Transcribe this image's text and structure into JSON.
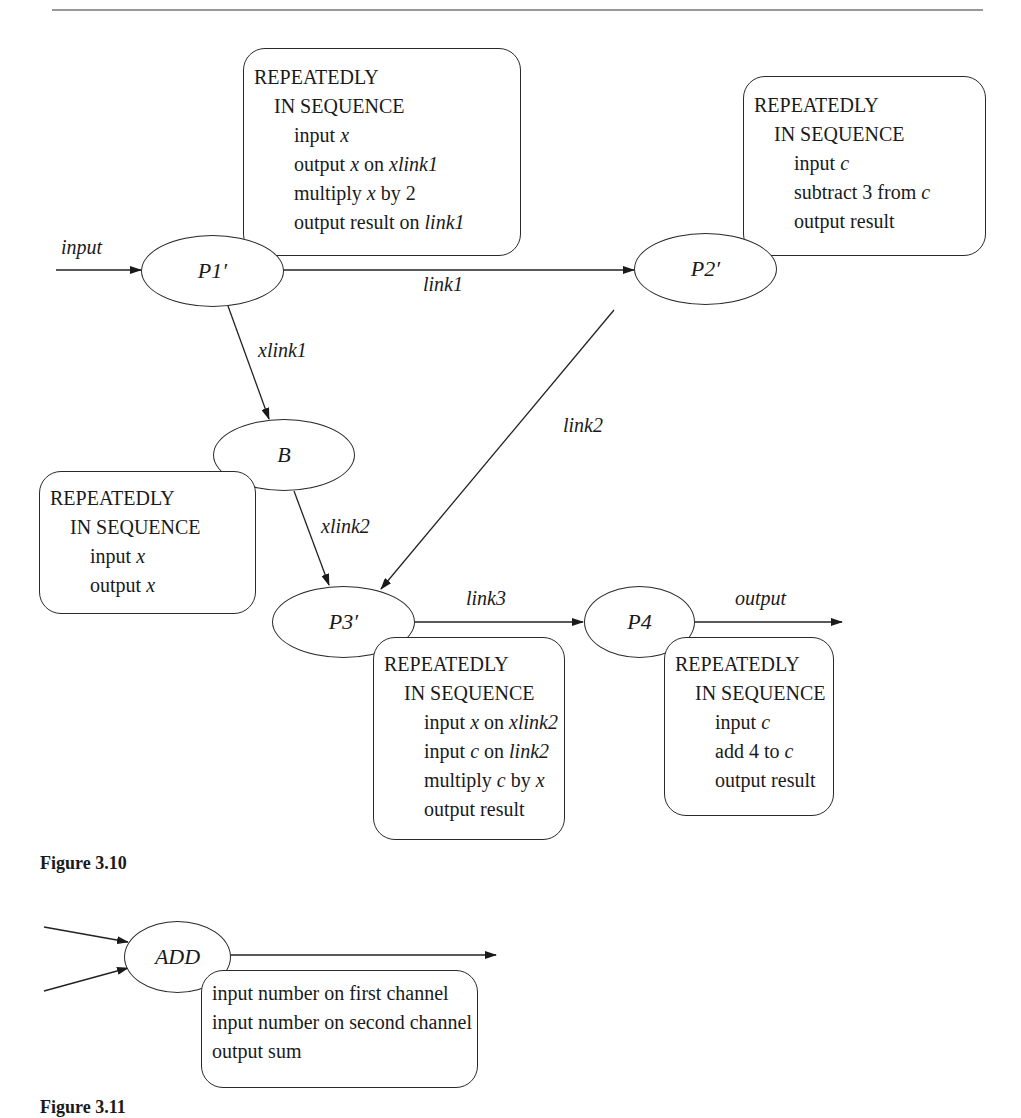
{
  "figure_3_10": {
    "caption": "Figure 3.10",
    "nodes": {
      "p1": "P1′",
      "p2": "P2′",
      "b": "B",
      "p3": "P3′",
      "p4": "P4"
    },
    "edges": {
      "input": "input",
      "link1": "link1",
      "xlink1": "xlink1",
      "link2": "link2",
      "xlink2": "xlink2",
      "link3": "link3",
      "output": "output"
    },
    "boxes": {
      "p1": {
        "header1": "REPEATEDLY",
        "header2": "IN SEQUENCE",
        "lines": [
          {
            "a": "input ",
            "b": "x",
            "c": "",
            "d": ""
          },
          {
            "a": "output ",
            "b": "x",
            "c": " on ",
            "d": "xlink1"
          },
          {
            "a": "multiply ",
            "b": "x",
            "c": " by 2",
            "d": ""
          },
          {
            "a": "output result on ",
            "b": "",
            "c": "",
            "d": "link1"
          }
        ]
      },
      "p2": {
        "header1": "REPEATEDLY",
        "header2": "IN SEQUENCE",
        "lines": [
          {
            "a": "input ",
            "b": "c",
            "c": "",
            "d": ""
          },
          {
            "a": "subtract 3 from ",
            "b": "c",
            "c": "",
            "d": ""
          },
          {
            "a": "output result",
            "b": "",
            "c": "",
            "d": ""
          }
        ]
      },
      "b": {
        "header1": "REPEATEDLY",
        "header2": "IN SEQUENCE",
        "lines": [
          {
            "a": "input ",
            "b": "x",
            "c": "",
            "d": ""
          },
          {
            "a": "output ",
            "b": "x",
            "c": "",
            "d": ""
          }
        ]
      },
      "p3": {
        "header1": "REPEATEDLY",
        "header2": "IN SEQUENCE",
        "lines": [
          {
            "a": "input ",
            "b": "x",
            "c": " on ",
            "d": "xlink2"
          },
          {
            "a": "input ",
            "b": "c",
            "c": " on ",
            "d": "link2"
          },
          {
            "a": "multiply ",
            "b": "c",
            "c": " by ",
            "d": "x"
          },
          {
            "a": "output result",
            "b": "",
            "c": "",
            "d": ""
          }
        ]
      },
      "p4": {
        "header1": "REPEATEDLY",
        "header2": "IN SEQUENCE",
        "lines": [
          {
            "a": "input ",
            "b": "c",
            "c": "",
            "d": ""
          },
          {
            "a": "add 4 to ",
            "b": "c",
            "c": "",
            "d": ""
          },
          {
            "a": "output result",
            "b": "",
            "c": "",
            "d": ""
          }
        ]
      }
    }
  },
  "figure_3_11": {
    "caption": "Figure 3.11",
    "node": "ADD",
    "box_lines": [
      "input number on first channel",
      "input number on second channel",
      "output sum"
    ]
  }
}
